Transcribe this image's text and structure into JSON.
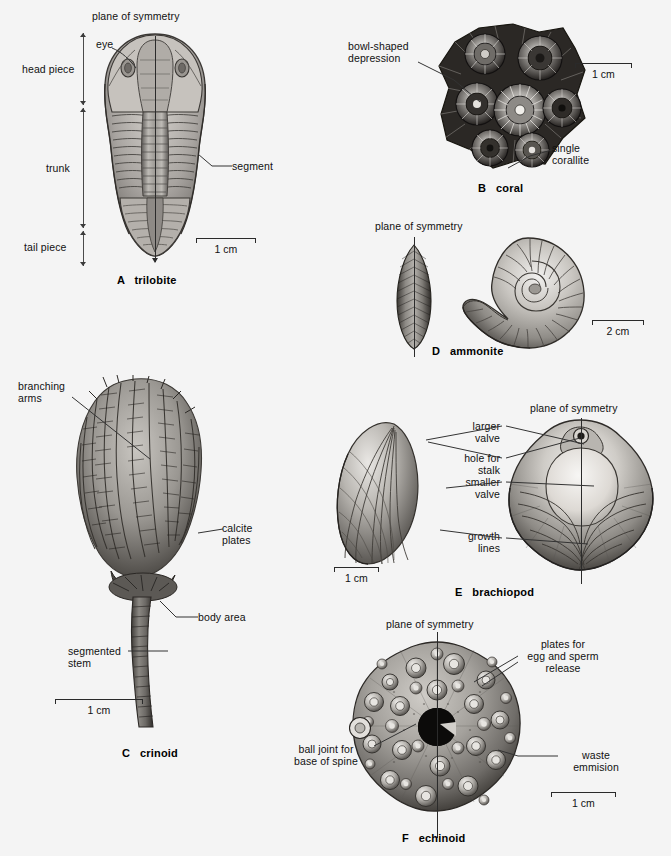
{
  "figure": {
    "background": "#f4f4f4",
    "ink": "#1a1a1a"
  },
  "panels": [
    {
      "id": "A",
      "caption": "A   trilobite",
      "specimen": "trilobite",
      "labels": [
        {
          "name": "plane-of-symmetry",
          "text": "plane of symmetry"
        },
        {
          "name": "eye",
          "text": "eye"
        },
        {
          "name": "head-piece",
          "text": "head piece"
        },
        {
          "name": "trunk",
          "text": "trunk"
        },
        {
          "name": "tail-piece",
          "text": "tail piece"
        },
        {
          "name": "segment",
          "text": "segment"
        }
      ],
      "scale": {
        "text": "1 cm",
        "length_px": 60
      }
    },
    {
      "id": "B",
      "caption": "B   coral",
      "specimen": "coral",
      "labels": [
        {
          "name": "bowl-shaped-depression",
          "text": "bowl-shaped\ndepression"
        },
        {
          "name": "single-corallite",
          "text": "single\ncorallite"
        }
      ],
      "scale": {
        "text": "1 cm",
        "length_px": 57
      }
    },
    {
      "id": "C",
      "caption": "C   crinoid",
      "specimen": "crinoid",
      "labels": [
        {
          "name": "branching-arms",
          "text": "branching\narms"
        },
        {
          "name": "calcite-plates",
          "text": "calcite\nplates"
        },
        {
          "name": "body-area",
          "text": "body area"
        },
        {
          "name": "segmented-stem",
          "text": "segmented\nstem"
        }
      ],
      "scale": {
        "text": "1 cm",
        "length_px": 88
      }
    },
    {
      "id": "D",
      "caption": "D   ammonite",
      "specimen": "ammonite",
      "labels": [
        {
          "name": "plane-of-symmetry",
          "text": "plane of symmetry"
        }
      ],
      "scale": {
        "text": "2 cm",
        "length_px": 52
      }
    },
    {
      "id": "E",
      "caption": "E   brachiopod",
      "specimen": "brachiopod",
      "labels": [
        {
          "name": "larger-valve",
          "text": "larger\nvalve"
        },
        {
          "name": "hole-for-stalk",
          "text": "hole for\nstalk"
        },
        {
          "name": "smaller-valve",
          "text": "smaller\nvalve"
        },
        {
          "name": "growth-lines",
          "text": "growth\nlines"
        },
        {
          "name": "plane-of-symmetry",
          "text": "plane of symmetry"
        }
      ],
      "scale": {
        "text": "1 cm",
        "length_px": 45
      }
    },
    {
      "id": "F",
      "caption": "F   echinoid",
      "specimen": "echinoid",
      "labels": [
        {
          "name": "plane-of-symmetry",
          "text": "plane of symmetry"
        },
        {
          "name": "plates-for-egg-and-sperm-release",
          "text": "plates for\negg and sperm\nrelease"
        },
        {
          "name": "ball-joint-for-base-of-spine",
          "text": "ball joint for\nbase of spine"
        },
        {
          "name": "waste-emmision",
          "text": "waste\nemmision"
        }
      ],
      "scale": {
        "text": "1 cm",
        "length_px": 65
      }
    }
  ]
}
